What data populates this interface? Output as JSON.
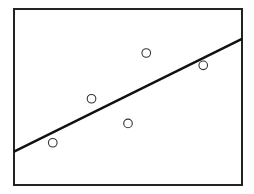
{
  "chart_data": {
    "type": "scatter",
    "title": "",
    "xlabel": "",
    "ylabel": "",
    "grid": false,
    "legend": null,
    "xlim": [
      0,
      10
    ],
    "ylim": [
      0,
      10
    ],
    "points": [
      {
        "x": 1.7,
        "y": 2.4
      },
      {
        "x": 3.4,
        "y": 4.9
      },
      {
        "x": 5.0,
        "y": 3.5
      },
      {
        "x": 5.8,
        "y": 7.5
      },
      {
        "x": 8.3,
        "y": 6.8
      }
    ],
    "fit_line": {
      "x": [
        0,
        10
      ],
      "y": [
        1.9,
        8.3
      ]
    }
  },
  "style": {
    "frame": {
      "left": 14,
      "top": 9,
      "right": 242,
      "bottom": 185
    },
    "line_color": "#111111",
    "marker_color": "#333333"
  }
}
